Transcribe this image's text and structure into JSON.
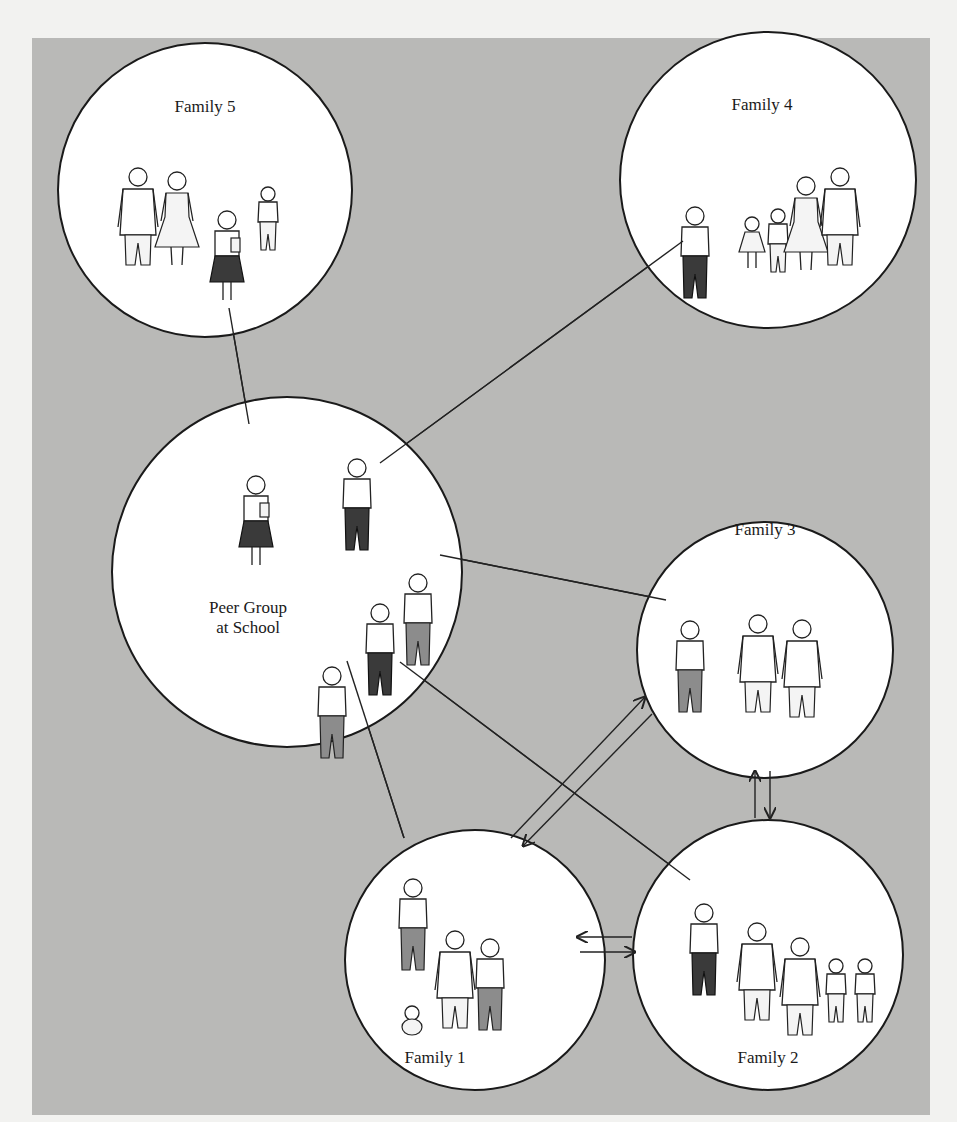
{
  "diagram": {
    "title": "",
    "background_color": "#b9b9b7",
    "circle_fill": "#ffffff",
    "groups": {
      "family5": {
        "label": "Family 5",
        "cx": 205,
        "cy": 190,
        "r": 147,
        "members": [
          "father",
          "mother",
          "daughter (student with book, dark skirt)",
          "younger daughter"
        ]
      },
      "family4": {
        "label": "Family 4",
        "cx": 768,
        "cy": 180,
        "r": 148,
        "members": [
          "son (student with book, dark pants)",
          "young girl",
          "daughter",
          "mother",
          "father"
        ]
      },
      "peer": {
        "label_line1": "Peer Group",
        "label_line2": "at School",
        "cx": 287,
        "cy": 572,
        "r": 175,
        "members": [
          "girl with book, dark skirt",
          "boy with book, dark pants",
          "boy, mid-gray pants",
          "girl, dark pants",
          "girl, mid-gray pants"
        ]
      },
      "family3": {
        "label": "Family 3",
        "cx": 765,
        "cy": 650,
        "r": 128,
        "members": [
          "son (mid-gray pants)",
          "mother",
          "father in jacket"
        ]
      },
      "family1": {
        "label": "Family 1",
        "cx": 475,
        "cy": 960,
        "r": 130,
        "members": [
          "daughter (mid-gray pants)",
          "father",
          "mother",
          "baby"
        ]
      },
      "family2": {
        "label": "Family 2",
        "cx": 768,
        "cy": 955,
        "r": 135,
        "members": [
          "daughter (dark pants)",
          "father",
          "mother",
          "son",
          "son"
        ]
      }
    },
    "links": [
      {
        "from": "family5",
        "to": "peer",
        "type": "line",
        "x1": 229,
        "y1": 308,
        "x2": 249,
        "y2": 424
      },
      {
        "from": "peer",
        "to": "family4",
        "type": "line",
        "x1": 380,
        "y1": 463,
        "x2": 683,
        "y2": 241
      },
      {
        "from": "peer",
        "to": "family3",
        "type": "line",
        "x1": 440,
        "y1": 555,
        "x2": 666,
        "y2": 600
      },
      {
        "from": "peer",
        "to": "family2",
        "type": "line",
        "x1": 400,
        "y1": 662,
        "x2": 690,
        "y2": 880
      },
      {
        "from": "peer",
        "to": "family1",
        "type": "line",
        "x1": 347,
        "y1": 661,
        "x2": 404,
        "y2": 838
      }
    ],
    "arrows": [
      {
        "between": [
          "family1",
          "family3"
        ],
        "direction": "to family3",
        "x1": 511,
        "y1": 838,
        "x2": 645,
        "y2": 697
      },
      {
        "between": [
          "family3",
          "family1"
        ],
        "direction": "to family1",
        "x1": 652,
        "y1": 714,
        "x2": 523,
        "y2": 846
      },
      {
        "between": [
          "family2",
          "family3"
        ],
        "direction": "to family3",
        "x1": 755,
        "y1": 818,
        "x2": 755,
        "y2": 771
      },
      {
        "between": [
          "family3",
          "family2"
        ],
        "direction": "to family2",
        "x1": 770,
        "y1": 771,
        "x2": 770,
        "y2": 818
      },
      {
        "between": [
          "family2",
          "family1"
        ],
        "direction": "to family1",
        "x1": 632,
        "y1": 937,
        "x2": 577,
        "y2": 937
      },
      {
        "between": [
          "family1",
          "family2"
        ],
        "direction": "to family2",
        "x1": 580,
        "y1": 952,
        "x2": 635,
        "y2": 952
      }
    ]
  }
}
